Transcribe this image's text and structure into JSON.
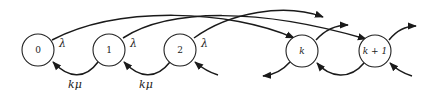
{
  "diagram": {
    "type": "state-transition / birth-death chain",
    "nodes": [
      {
        "id": "0",
        "label": "0"
      },
      {
        "id": "1",
        "label": "1"
      },
      {
        "id": "2",
        "label": "2"
      },
      {
        "id": "k",
        "label": "k"
      },
      {
        "id": "k+1",
        "label": "k + 1"
      }
    ],
    "edges": {
      "forward_label": "λ",
      "backward_label": "kμ",
      "forward": [
        {
          "from": "0",
          "to": "k",
          "label": "λ"
        },
        {
          "from": "1",
          "to": "k+1",
          "label": "λ"
        },
        {
          "from": "2",
          "to": "k+2 (off-screen)",
          "label": "λ"
        },
        {
          "from": "k",
          "to": "2k (off-screen)",
          "label": ""
        },
        {
          "from": "k+1",
          "to": "2k+1 (off-screen)",
          "label": ""
        }
      ],
      "backward": [
        {
          "from": "1",
          "to": "0",
          "label": "kμ"
        },
        {
          "from": "2",
          "to": "1",
          "label": "kμ"
        },
        {
          "from": "3 (off-screen)",
          "to": "2",
          "label": ""
        },
        {
          "from": "k",
          "to": "k-1 (off-screen)",
          "label": ""
        },
        {
          "from": "k+1",
          "to": "k",
          "label": ""
        },
        {
          "from": "k+2 (off-screen)",
          "to": "k+1",
          "label": ""
        }
      ]
    },
    "labels": {
      "lambda_0": "λ",
      "lambda_1": "λ",
      "lambda_2": "λ",
      "kmu_1": "kμ",
      "kmu_2": "kμ"
    }
  }
}
